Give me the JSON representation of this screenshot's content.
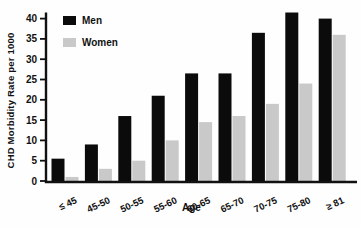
{
  "chart_data": {
    "type": "bar",
    "title": "",
    "xlabel": "Age",
    "ylabel": "CHD Morbidity Rate per 1000",
    "categories": [
      "≤ 45",
      "45-50",
      "50-55",
      "55-60",
      "60-65",
      "65-70",
      "70-75",
      "75-80",
      "≥ 81"
    ],
    "series": [
      {
        "name": "Men",
        "color": "#0b0b0b",
        "values": [
          5.5,
          9,
          16,
          21,
          26.5,
          26.5,
          36.5,
          41.5,
          40
        ]
      },
      {
        "name": "Women",
        "color": "#c9c9c9",
        "values": [
          1,
          3,
          5,
          10,
          14.5,
          16,
          19,
          24,
          36
        ]
      }
    ],
    "ylim": [
      0,
      40
    ],
    "yticks": [
      0,
      5,
      10,
      15,
      20,
      25,
      30,
      35,
      40
    ],
    "grid": false,
    "legend_position": "top-left",
    "axis_color": "#111111"
  }
}
